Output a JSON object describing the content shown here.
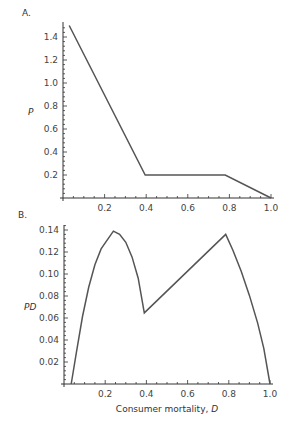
{
  "chart_data": [
    {
      "panel_label": "A.",
      "type": "line",
      "title": "",
      "xlabel": "",
      "ylabel": "P",
      "xlim": [
        0,
        1.0
      ],
      "ylim": [
        0,
        1.55
      ],
      "x_ticks": [
        0.2,
        0.4,
        0.6,
        0.8,
        1.0
      ],
      "x_tick_labels": [
        "0.2",
        "0.4",
        "0.6",
        "0.8",
        "1.0"
      ],
      "y_ticks": [
        0.2,
        0.4,
        0.6,
        0.8,
        1.0,
        1.2,
        1.4
      ],
      "y_tick_labels": [
        "0.2",
        "0.4",
        "0.6",
        "0.8",
        "1.0",
        "1.2",
        "1.4"
      ],
      "grid": false,
      "series": [
        {
          "name": "P",
          "x": [
            0.03,
            0.395,
            0.78,
            1.0
          ],
          "y": [
            1.5,
            0.2,
            0.2,
            0.0
          ]
        }
      ]
    },
    {
      "panel_label": "B.",
      "type": "line",
      "title": "",
      "xlabel": "Consumer mortality, ",
      "xlabel_italic": "D",
      "ylabel": "PD",
      "xlim": [
        0,
        1.0
      ],
      "ylim": [
        0,
        0.142
      ],
      "x_ticks": [
        0.2,
        0.4,
        0.6,
        0.8,
        1.0
      ],
      "x_tick_labels": [
        "0.2",
        "0.4",
        "0.6",
        "0.8",
        "1.0"
      ],
      "y_ticks": [
        0.02,
        0.04,
        0.06,
        0.08,
        0.1,
        0.12,
        0.14
      ],
      "y_tick_labels": [
        "0.02",
        "0.04",
        "0.06",
        "0.08",
        "0.10",
        "0.12",
        "0.14"
      ],
      "grid": false,
      "series": [
        {
          "name": "PD",
          "x": [
            0.035,
            0.06,
            0.09,
            0.12,
            0.15,
            0.18,
            0.21,
            0.24,
            0.27,
            0.3,
            0.33,
            0.36,
            0.39,
            0.785,
            0.82,
            0.86,
            0.9,
            0.94,
            0.97,
            1.0
          ],
          "y": [
            0.0,
            0.0288,
            0.0614,
            0.0879,
            0.1084,
            0.1228,
            0.1311,
            0.139,
            0.1361,
            0.1288,
            0.1155,
            0.0962,
            0.0646,
            0.136,
            0.1215,
            0.1025,
            0.0805,
            0.0555,
            0.0325,
            0.0
          ]
        }
      ]
    }
  ]
}
